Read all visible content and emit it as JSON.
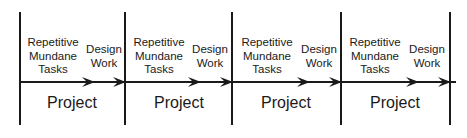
{
  "segments": [
    {
      "task_label_1": "Repetitive",
      "task_label_2": "Mundane",
      "task_label_3": "Tasks",
      "design_label_1": "Design",
      "design_label_2": "Work",
      "project_label": "Project"
    },
    {
      "task_label_1": "Repetitive",
      "task_label_2": "Mundane",
      "task_label_3": "Tasks",
      "design_label_1": "Design",
      "design_label_2": "Work",
      "project_label": "Project"
    },
    {
      "task_label_1": "Repetitive",
      "task_label_2": "Mundane",
      "task_label_3": "Tasks",
      "design_label_1": "Design",
      "design_label_2": "Work",
      "project_label": "Project"
    },
    {
      "task_label_1": "Repetitive",
      "task_label_2": "Mundane",
      "task_label_3": "Tasks",
      "design_label_1": "Design",
      "design_label_2": "Work",
      "project_label": "Project"
    }
  ],
  "colors": {
    "line": "#1a1a1a",
    "background": "#ffffff"
  }
}
